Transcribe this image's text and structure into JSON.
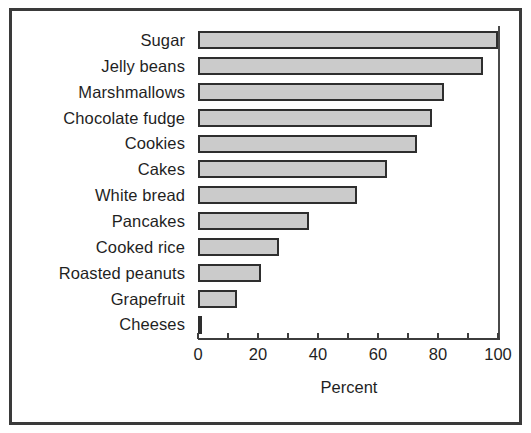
{
  "chart_data": {
    "type": "bar",
    "orientation": "horizontal",
    "title": "",
    "xlabel": "Percent",
    "ylabel": "",
    "categories": [
      "Sugar",
      "Jelly beans",
      "Marshmallows",
      "Chocolate fudge",
      "Cookies",
      "Cakes",
      "White bread",
      "Pancakes",
      "Cooked rice",
      "Roasted peanuts",
      "Grapefruit",
      "Cheeses"
    ],
    "values": [
      100,
      95,
      82,
      78,
      73,
      63,
      53,
      37,
      27,
      21,
      13,
      1
    ],
    "xlim": [
      0,
      100
    ],
    "xticks": [
      0,
      10,
      20,
      30,
      40,
      50,
      60,
      70,
      80,
      90,
      100
    ],
    "xtick_labels": [
      "0",
      "",
      "20",
      "",
      "40",
      "",
      "60",
      "",
      "80",
      "",
      "100"
    ],
    "grid": false,
    "legend": null,
    "bar_fill_color": "#cbcbcb",
    "bar_edge_color": "#2e2e2e",
    "frame_color": "#3a3a3a",
    "background_color": "#ffffff"
  }
}
